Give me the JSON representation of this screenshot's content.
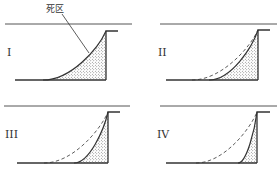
{
  "figure": {
    "annotation_label": "死区",
    "colors": {
      "line": "#333333",
      "guide_line": "#555555",
      "stipple": "#444444",
      "background": "#ffffff"
    },
    "panels": [
      {
        "id": "I",
        "numeral": "I",
        "top_line": {
          "x1": 5,
          "x2": 132,
          "y": 24
        },
        "wall": {
          "x": 106,
          "top": 31,
          "ledge_x": 118
        },
        "base": {
          "x1": 15,
          "y": 80
        },
        "solid_curve_start_x": 43,
        "dashed_curve_start_x": null,
        "numeral_pos": {
          "x": 7,
          "y": 56
        }
      },
      {
        "id": "II",
        "numeral": "II",
        "top_line": {
          "x1": 160,
          "x2": 277,
          "y": 24
        },
        "wall": {
          "x": 258,
          "top": 30,
          "ledge_x": 270
        },
        "base": {
          "x1": 166,
          "y": 80
        },
        "solid_curve_start_x": 209,
        "dashed_curve_start_x": 192,
        "numeral_pos": {
          "x": 158,
          "y": 56
        }
      },
      {
        "id": "III",
        "numeral": "III",
        "top_line": {
          "x1": 4,
          "x2": 130,
          "y": 106
        },
        "wall": {
          "x": 108,
          "top": 112,
          "ledge_x": 120
        },
        "base": {
          "x1": 17,
          "y": 163
        },
        "solid_curve_start_x": 74,
        "dashed_curve_start_x": 44,
        "numeral_pos": {
          "x": 5,
          "y": 138
        }
      },
      {
        "id": "IV",
        "numeral": "IV",
        "top_line": {
          "x1": 160,
          "x2": 277,
          "y": 106
        },
        "wall": {
          "x": 257,
          "top": 112,
          "ledge_x": 270
        },
        "base": {
          "x1": 166,
          "y": 163
        },
        "solid_curve_start_x": 238,
        "dashed_curve_start_x": 196,
        "numeral_pos": {
          "x": 157,
          "y": 138
        }
      }
    ],
    "annotation": {
      "text_pos": {
        "x": 46,
        "y": 12
      },
      "leader": {
        "x1": 62,
        "y1": 14,
        "x2": 89,
        "y2": 53
      }
    }
  }
}
